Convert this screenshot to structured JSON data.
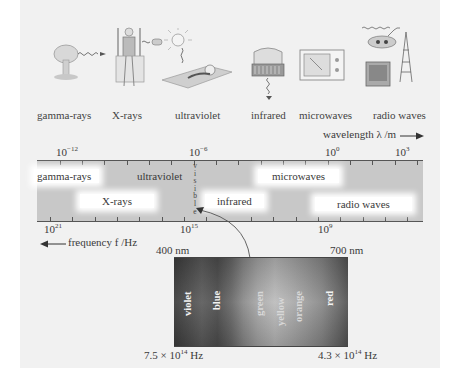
{
  "illustrations": [
    {
      "label": "gamma-rays",
      "icon": "mushroom-cloud-icon"
    },
    {
      "label": "X-rays",
      "icon": "xray-person-icon"
    },
    {
      "label": "ultraviolet",
      "icon": "sunbather-icon"
    },
    {
      "label": "infrared",
      "icon": "heater-icon"
    },
    {
      "label": "microwaves",
      "icon": "microwave-oven-icon"
    },
    {
      "label": "radio waves",
      "icon": "radio-tv-tower-icon"
    }
  ],
  "wavelength_axis": {
    "title": "wavelength λ /m",
    "ticks": [
      {
        "base": "10",
        "exp": "−12"
      },
      {
        "base": "10",
        "exp": "−6"
      },
      {
        "base": "10",
        "exp": "0"
      },
      {
        "base": "10",
        "exp": "3"
      }
    ]
  },
  "frequency_axis": {
    "title": "frequency f /Hz",
    "ticks": [
      {
        "base": "10",
        "exp": "21"
      },
      {
        "base": "10",
        "exp": "15"
      },
      {
        "base": "10",
        "exp": "9"
      }
    ]
  },
  "bands": {
    "gamma": "gamma-rays",
    "ultraviolet": "ultraviolet",
    "microwaves": "microwaves",
    "xrays": "X-rays",
    "infrared": "infrared",
    "radio": "radio waves",
    "visible_letters": [
      "v",
      "i",
      "s",
      "i",
      "b",
      "l",
      "e"
    ]
  },
  "visible_spectrum": {
    "wavelength_left": "400 nm",
    "wavelength_right": "700 nm",
    "freq_left": {
      "mant": "7.5 × 10",
      "exp": "14",
      "unit": " Hz"
    },
    "freq_right": {
      "mant": "4.3 × 10",
      "exp": "14",
      "unit": " Hz"
    },
    "colors": [
      "violet",
      "blue",
      "green",
      "yellow",
      "orange",
      "red"
    ]
  }
}
